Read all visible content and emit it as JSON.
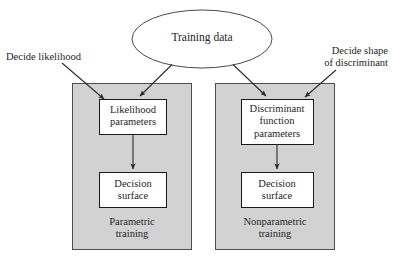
{
  "figure": {
    "type": "flow-diagram",
    "background_color": "#ffffff",
    "panel_fill_color": "#d2d2d2",
    "panel_stroke_color": "#4d4d4d",
    "node_fill_color": "#ffffff",
    "node_stroke_color": "#1a1a1a",
    "arrow_color": "#333333"
  },
  "source": {
    "label": "Training data",
    "shape": "ellipse"
  },
  "annotations": {
    "left": "Decide likelihood",
    "right": "Decide shape\nof discriminant"
  },
  "panels": [
    {
      "id": "parametric",
      "caption": "Parametric\ntraining",
      "nodes": [
        {
          "id": "likelihood-parameters",
          "label": "Likelihood\nparameters"
        },
        {
          "id": "decision-surface-parametric",
          "label": "Decision\nsurface"
        }
      ]
    },
    {
      "id": "nonparametric",
      "caption": "Nonparametric\ntraining",
      "nodes": [
        {
          "id": "discriminant-function-parameters",
          "label": "Discriminant\nfunction\nparameters"
        },
        {
          "id": "decision-surface-nonparametric",
          "label": "Decision\nsurface"
        }
      ]
    }
  ],
  "edges": [
    {
      "from": "training-data",
      "to": "likelihood-parameters"
    },
    {
      "from": "training-data",
      "to": "discriminant-function-parameters"
    },
    {
      "from": "decide-likelihood-label",
      "to": "parametric-panel"
    },
    {
      "from": "decide-shape-label",
      "to": "nonparametric-panel"
    },
    {
      "from": "likelihood-parameters",
      "to": "decision-surface-parametric"
    },
    {
      "from": "discriminant-function-parameters",
      "to": "decision-surface-nonparametric"
    }
  ]
}
